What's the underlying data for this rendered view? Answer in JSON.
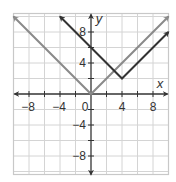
{
  "chart_data": {
    "type": "line",
    "title": "",
    "xlabel": "x",
    "ylabel": "y",
    "xlim": [
      -10,
      10
    ],
    "ylim": [
      -10,
      10
    ],
    "grid": true,
    "grid_step": 2,
    "x_ticks": [
      -8,
      -4,
      0,
      4,
      8
    ],
    "y_ticks": [
      8,
      4,
      -4,
      -8
    ],
    "x_tick_labels": [
      "−8",
      "−4",
      "0",
      "4",
      "8"
    ],
    "y_tick_labels": [
      "8",
      "4",
      "−4",
      "−8"
    ],
    "origin_label": "0",
    "series": [
      {
        "name": "y = |x|",
        "color": "#8a8a8a",
        "points": [
          [
            -10,
            10
          ],
          [
            0,
            0
          ],
          [
            10,
            10
          ]
        ],
        "arrows": "both"
      },
      {
        "name": "y = |x - 4| + 2",
        "color": "#333333",
        "points": [
          [
            -4,
            10
          ],
          [
            4,
            2
          ],
          [
            10,
            8
          ]
        ],
        "arrows": "both"
      }
    ],
    "legend": null
  },
  "colors": {
    "grid": "#d4d4d4",
    "border": "#c8c8c8",
    "axis": "#333333"
  }
}
